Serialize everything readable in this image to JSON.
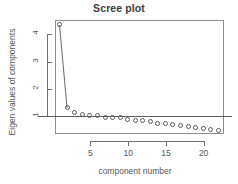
{
  "chart_data": {
    "type": "line",
    "title": "Scree plot",
    "xlabel": "component number",
    "ylabel": "Eigen values of components",
    "x": [
      1,
      2,
      3,
      4,
      5,
      6,
      7,
      8,
      9,
      10,
      11,
      12,
      13,
      14,
      15,
      16,
      17,
      18,
      19,
      20,
      21,
      22
    ],
    "values": [
      4.32,
      1.3,
      1.13,
      1.05,
      1.0,
      1.0,
      0.96,
      0.94,
      0.93,
      0.88,
      0.85,
      0.82,
      0.79,
      0.74,
      0.71,
      0.68,
      0.64,
      0.6,
      0.57,
      0.54,
      0.5,
      0.46
    ],
    "categories": [
      "1",
      "2",
      "3",
      "4",
      "5",
      "6",
      "7",
      "8",
      "9",
      "10",
      "11",
      "12",
      "13",
      "14",
      "15",
      "16",
      "17",
      "18",
      "19",
      "20",
      "21",
      "22"
    ],
    "series": [
      {
        "name": "eigenvalues",
        "values": [
          4.32,
          1.3,
          1.13,
          1.05,
          1.0,
          1.0,
          0.96,
          0.94,
          0.93,
          0.88,
          0.85,
          0.82,
          0.79,
          0.74,
          0.71,
          0.68,
          0.64,
          0.6,
          0.57,
          0.54,
          0.5,
          0.46
        ]
      }
    ],
    "xlim": [
      0.3,
      22.7
    ],
    "ylim": [
      0.36,
      4.52
    ],
    "xticks": [
      5,
      10,
      15,
      20
    ],
    "xtick_labels": [
      "5",
      "10",
      "15",
      "20"
    ],
    "yticks": [
      1,
      2,
      3,
      4
    ],
    "ytick_labels": [
      "1",
      "2",
      "3",
      "4"
    ],
    "grid": false,
    "legend": "none",
    "marker": "open-circle",
    "line_connects_points": [
      1,
      2
    ],
    "reference_line": {
      "orientation": "horizontal",
      "value": 1,
      "label": ""
    },
    "colors": {
      "marker": "#5a5a5a",
      "line": "#6a6a6a",
      "axis": "#6f6f6f",
      "frame": "#8d8d8d",
      "text": "#555555",
      "title": "#3d3d3d",
      "background": "#ffffff"
    }
  }
}
